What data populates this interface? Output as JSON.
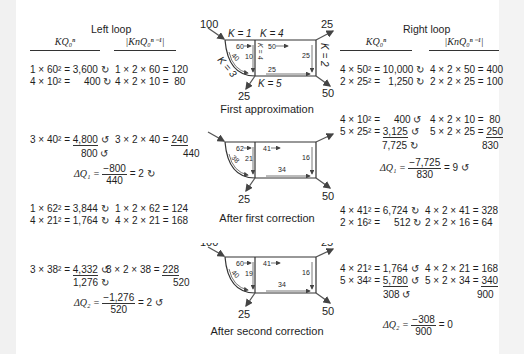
{
  "left": {
    "title": "Left loop",
    "col1_header": "KQ₀ⁿ",
    "col2_header": "|KnQ₀ⁿ⁻¹|",
    "block1": {
      "rows": [
        {
          "a": "1 × 60² = 3,600 ↻",
          "b": "1 × 2 × 60 = 120"
        },
        {
          "a": "4 × 10² =     400 ↻",
          "b": "4 × 2 × 10 =  80"
        }
      ]
    },
    "block2": {
      "row": {
        "a_prefix": "3 × 40² = ",
        "a_val": "4,800",
        "a_dir": " ↺",
        "b_prefix": "3 × 2 × 40 = ",
        "b_val": "240"
      },
      "sum_a": "800 ↺",
      "sum_b": "440",
      "dq_label": "ΔQ₁ = ",
      "dq_num": "−800",
      "dq_den": "440",
      "dq_result": " = 2 ↻"
    },
    "block3": {
      "rows": [
        {
          "a": "1 × 62² = 3,844 ↻",
          "b": "1 × 2 × 62 = 124"
        },
        {
          "a": "4 × 21² = 1,764 ↻",
          "b": "4 × 2 × 21 = 168"
        }
      ]
    },
    "block4": {
      "row": {
        "a_prefix": "3 × 38² = ",
        "a_val": "4,332",
        "a_dir": " ↺",
        "b_prefix": "3 × 2 × 38 = ",
        "b_val": "228"
      },
      "sum_a": "1,276 ↻",
      "sum_b": "520",
      "dq_label": "ΔQ₂ = ",
      "dq_num": "−1,276",
      "dq_den": "520",
      "dq_result": " = 2 ↺"
    }
  },
  "right": {
    "title": "Right loop",
    "col1_header": "KQ₀ⁿ",
    "col2_header": "|KnQ₀ⁿ⁻¹|",
    "block1": {
      "rows": [
        {
          "a": "4 × 50² = 10,000 ↻",
          "b": "4 × 2 × 50 = 400"
        },
        {
          "a": "2 × 25² =   1,250 ↻",
          "b": "2 × 2 × 25 = 100"
        }
      ]
    },
    "block2": {
      "rows": [
        {
          "a": "4 × 10² =     400 ↺",
          "b": "4 × 2 × 10 =  80"
        }
      ],
      "row_ul": {
        "a_prefix": "5 × 25² = ",
        "a_val": "3,125",
        "a_dir": " ↺",
        "b_prefix": "5 × 2 × 25 = ",
        "b_val": "250"
      },
      "sum_a": "7,725 ↻",
      "sum_b": "830",
      "dq_label": "ΔQ₁ = ",
      "dq_num": "−7,725",
      "dq_den": "830",
      "dq_result": " = 9 ↺"
    },
    "block3": {
      "rows": [
        {
          "a": "4 × 41² = 6,724 ↻",
          "b": "4 × 2 × 41 = 328"
        },
        {
          "a": "2 × 16² =     512 ↻",
          "b": "2 × 2 × 16 = 64"
        }
      ]
    },
    "block4": {
      "rows": [
        {
          "a": "4 × 21² = 1,764 ↺",
          "b": "4 × 2 × 21 = 168"
        }
      ],
      "row_ul": {
        "a_prefix": "5 × 34² = ",
        "a_val": "5,780",
        "a_dir": " ↺",
        "b_prefix": "5 × 2 × 34 = ",
        "b_val": "340"
      },
      "sum_a": "308 ↺",
      "sum_b": "900",
      "dq_label": "ΔQ₂ = ",
      "dq_num": "−308",
      "dq_den": "900",
      "dq_result": " = 0"
    }
  },
  "diagrams": [
    {
      "caption": "First approximation",
      "inflow": "100",
      "out_top_right": "25",
      "out_bottom_right": "50",
      "out_bottom": "25",
      "k_top_left": "K = 1",
      "k_top_right": "K = 4",
      "k_right": "K = 2",
      "k_bottom": "K = 5",
      "k_curve": "K = 3",
      "k_middle": "K = 4",
      "flow_top_left": "60",
      "flow_middle": "10",
      "flow_curve": "40",
      "flow_top_right": "50",
      "flow_right": "25",
      "flow_bottom": "25"
    },
    {
      "caption": "After first correction",
      "inflow": "100",
      "out_top_right": "25",
      "out_bottom_right": "50",
      "out_bottom": "25",
      "flow_top_left": "62",
      "flow_middle": "21",
      "flow_curve": "38",
      "flow_top_right": "41",
      "flow_right": "16",
      "flow_bottom": "34"
    },
    {
      "caption": "After second correction",
      "inflow": "100",
      "out_top_right": "25",
      "out_bottom_right": "50",
      "out_bottom": "25",
      "flow_top_left": "60",
      "flow_middle": "19",
      "flow_curve": "40",
      "flow_top_right": "41",
      "flow_right": "16",
      "flow_bottom": "34"
    }
  ]
}
